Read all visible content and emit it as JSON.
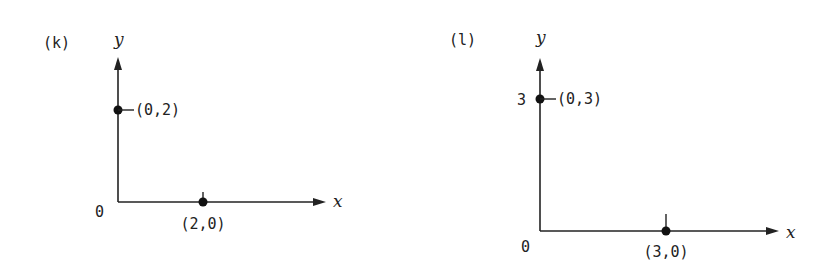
{
  "panels": [
    {
      "label": "(k)",
      "axes": {
        "x_label": "x",
        "y_label": "y",
        "origin_label": "0"
      },
      "points": [
        {
          "label": "(0,2)",
          "x": 0,
          "y": 2
        },
        {
          "label": "(2,0)",
          "x": 2,
          "y": 0
        }
      ],
      "y_tick_labels": []
    },
    {
      "label": "(l)",
      "axes": {
        "x_label": "x",
        "y_label": "y",
        "origin_label": "0"
      },
      "points": [
        {
          "label": "(0,3)",
          "x": 0,
          "y": 3
        },
        {
          "label": "(3,0)",
          "x": 3,
          "y": 0
        }
      ],
      "y_tick_labels": [
        "3"
      ]
    }
  ],
  "colors": {
    "ink": "#222222",
    "background": "#ffffff"
  }
}
